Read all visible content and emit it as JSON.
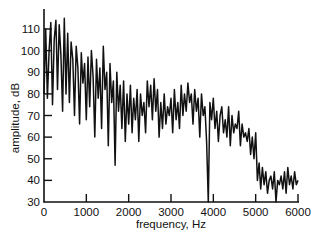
{
  "chart_data": {
    "type": "line",
    "title": "",
    "xlabel": "frequency, Hz",
    "ylabel": "amplitude, dB",
    "xlim": [
      0,
      6000
    ],
    "ylim": [
      30,
      118
    ],
    "xticks": [
      0,
      1000,
      2000,
      3000,
      4000,
      5000,
      6000
    ],
    "yticks": [
      30,
      40,
      50,
      60,
      70,
      80,
      90,
      100,
      110
    ],
    "grid": false,
    "legend": null,
    "series": [
      {
        "name": "spectrum",
        "color": "#111111",
        "x": [
          0,
          40,
          80,
          120,
          160,
          200,
          240,
          280,
          320,
          360,
          400,
          440,
          480,
          520,
          560,
          600,
          640,
          680,
          720,
          760,
          800,
          840,
          880,
          920,
          960,
          1000,
          1040,
          1080,
          1120,
          1160,
          1200,
          1240,
          1280,
          1320,
          1360,
          1400,
          1440,
          1480,
          1520,
          1560,
          1600,
          1640,
          1680,
          1720,
          1760,
          1800,
          1840,
          1880,
          1920,
          1960,
          2000,
          2040,
          2080,
          2120,
          2160,
          2200,
          2240,
          2280,
          2320,
          2360,
          2400,
          2440,
          2480,
          2520,
          2560,
          2600,
          2640,
          2680,
          2720,
          2760,
          2800,
          2840,
          2880,
          2920,
          2960,
          3000,
          3040,
          3080,
          3120,
          3160,
          3200,
          3240,
          3280,
          3320,
          3360,
          3400,
          3440,
          3480,
          3520,
          3560,
          3600,
          3640,
          3680,
          3720,
          3760,
          3800,
          3840,
          3880,
          3920,
          3960,
          4000,
          4040,
          4080,
          4120,
          4160,
          4200,
          4240,
          4280,
          4320,
          4360,
          4400,
          4440,
          4480,
          4520,
          4560,
          4600,
          4640,
          4680,
          4720,
          4760,
          4800,
          4840,
          4880,
          4920,
          4960,
          5000,
          5040,
          5080,
          5120,
          5160,
          5200,
          5240,
          5280,
          5320,
          5360,
          5400,
          5440,
          5480,
          5520,
          5560,
          5600,
          5640,
          5680,
          5720,
          5760,
          5800,
          5840,
          5880,
          5920,
          5960,
          6000
        ],
        "y": [
          80,
          110,
          78,
          100,
          113,
          75,
          105,
          114,
          82,
          112,
          98,
          72,
          115,
          80,
          108,
          76,
          104,
          96,
          70,
          102,
          92,
          66,
          99,
          85,
          94,
          68,
          97,
          74,
          100,
          88,
          60,
          96,
          78,
          92,
          64,
          102,
          82,
          90,
          56,
          94,
          76,
          86,
          47,
          90,
          72,
          84,
          64,
          86,
          58,
          80,
          66,
          84,
          62,
          78,
          68,
          82,
          58,
          80,
          70,
          76,
          62,
          86,
          74,
          84,
          68,
          87,
          72,
          82,
          60,
          76,
          64,
          80,
          66,
          74,
          70,
          78,
          62,
          82,
          68,
          76,
          64,
          84,
          70,
          80,
          72,
          85,
          76,
          80,
          66,
          82,
          72,
          78,
          60,
          80,
          70,
          74,
          58,
          30,
          76,
          68,
          78,
          64,
          72,
          58,
          70,
          74,
          62,
          68,
          60,
          74,
          56,
          70,
          62,
          66,
          64,
          72,
          56,
          66,
          60,
          62,
          58,
          64,
          52,
          60,
          50,
          62,
          40,
          48,
          36,
          46,
          38,
          44,
          34,
          40,
          42,
          36,
          44,
          30,
          40,
          38,
          42,
          36,
          44,
          34,
          46,
          38,
          42,
          36,
          44,
          38,
          40
        ]
      }
    ]
  }
}
